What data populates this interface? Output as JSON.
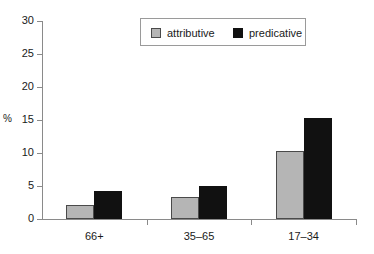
{
  "chart_data": {
    "type": "bar",
    "title": "",
    "xlabel": "",
    "ylabel": "%",
    "categories": [
      "66+",
      "35–65",
      "17–34"
    ],
    "series": [
      {
        "name": "attributive",
        "color": "#b5b5b5",
        "values": [
          2.1,
          3.4,
          10.3
        ]
      },
      {
        "name": "predicative",
        "color": "#111111",
        "values": [
          4.2,
          5.0,
          15.3
        ]
      }
    ],
    "ylim": [
      0,
      30
    ],
    "ytick_values": [
      0,
      5,
      10,
      15,
      20,
      25,
      30
    ],
    "ytick_labels": [
      "0",
      "5",
      "10",
      "15",
      "20",
      "25",
      "30"
    ],
    "grid": false,
    "legend_position": "top-center"
  },
  "legend": {
    "entries": [
      {
        "label": "attributive"
      },
      {
        "label": "predicative"
      }
    ]
  },
  "axes": {
    "y_axis_label": "%"
  }
}
